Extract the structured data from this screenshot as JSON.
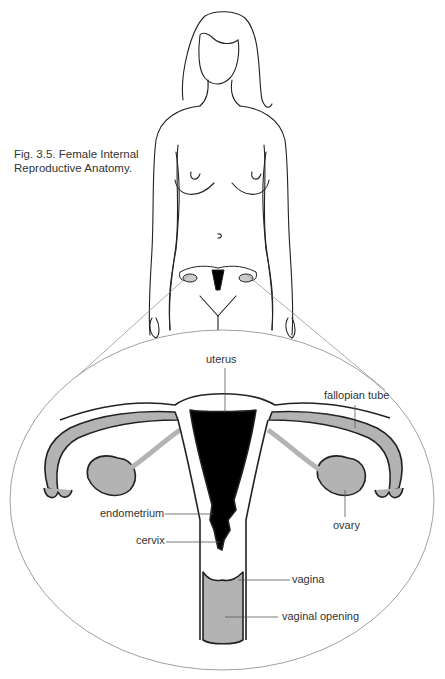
{
  "figure": {
    "caption_line1": "Fig. 3.5. Female Internal",
    "caption_line2": "Reproductive Anatomy."
  },
  "labels": {
    "uterus": "uterus",
    "fallopian_tube": "fallopian tube",
    "endometrium": "endometrium",
    "ovary": "ovary",
    "cervix": "cervix",
    "vagina": "vagina",
    "vaginal_opening": "vaginal opening"
  },
  "colors": {
    "line": "#222222",
    "tissue_fill": "#b3b3b3",
    "uterine_cavity": "#000000",
    "leader": "#555555"
  }
}
